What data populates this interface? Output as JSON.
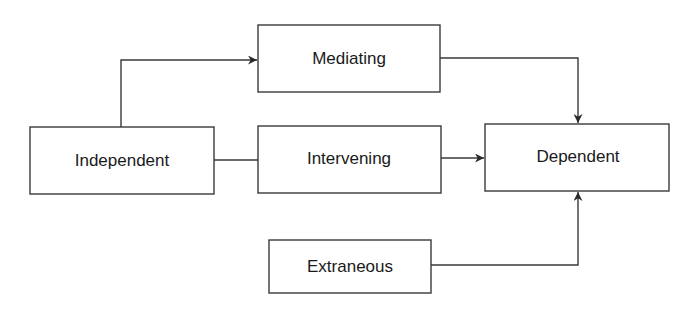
{
  "diagram": {
    "type": "variable-relationship-flowchart",
    "nodes": {
      "mediating": {
        "label": "Mediating",
        "x": 258,
        "y": 25,
        "w": 182,
        "h": 67
      },
      "independent": {
        "label": "Independent",
        "x": 30,
        "y": 127,
        "w": 184,
        "h": 67
      },
      "intervening": {
        "label": "Intervening",
        "x": 258,
        "y": 126,
        "w": 183,
        "h": 67
      },
      "dependent": {
        "label": "Dependent",
        "x": 485,
        "y": 124,
        "w": 184,
        "h": 67
      },
      "extraneous": {
        "label": "Extraneous",
        "x": 269,
        "y": 240,
        "w": 162,
        "h": 53
      }
    },
    "edges": [
      {
        "from": "independent",
        "to": "mediating",
        "arrow": true
      },
      {
        "from": "independent",
        "to": "intervening",
        "arrow": false
      },
      {
        "from": "intervening",
        "to": "dependent",
        "arrow": true
      },
      {
        "from": "mediating",
        "to": "dependent",
        "arrow": true
      },
      {
        "from": "extraneous",
        "to": "dependent",
        "arrow": true
      }
    ],
    "colors": {
      "stroke": "#3a3a3a",
      "text": "#1a1a1a",
      "background": "#ffffff"
    }
  }
}
